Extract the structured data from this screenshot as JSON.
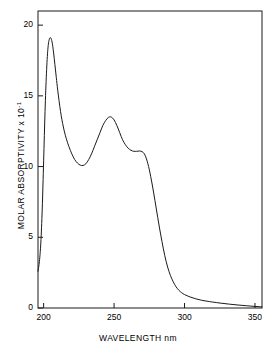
{
  "chart_data": {
    "type": "line",
    "title": "",
    "subtitle": "",
    "xlabel": "WAVELENGTH nm",
    "ylabel": "MOLAR ABSORPTIVITY x 10",
    "ylabel_exponent": "-1",
    "xlim": [
      196,
      355
    ],
    "ylim": [
      0,
      21
    ],
    "xticks": [
      200,
      250,
      300,
      350
    ],
    "xtick_labels": [
      "200",
      "250",
      "300",
      "350"
    ],
    "yticks": [
      0,
      5,
      10,
      15,
      20
    ],
    "ytick_labels": [
      "0",
      "5",
      "10",
      "15",
      "20"
    ],
    "grid": false,
    "legend": null,
    "line_color": "#1a1a1a",
    "line_width": 1.0,
    "frame": true,
    "annotations": [
      {
        "label": "primary peak",
        "x": 205,
        "y": 19.1
      },
      {
        "label": "minimum",
        "x": 228,
        "y": 10.1
      },
      {
        "label": "secondary peak",
        "x": 246,
        "y": 13.5
      },
      {
        "label": "shoulder",
        "x": 268,
        "y": 11.1
      },
      {
        "label": "baseline tail",
        "x": 350,
        "y": 0.1
      }
    ],
    "series": [
      {
        "name": "absorption spectrum",
        "x": [
          196,
          197,
          198,
          199,
          200,
          201,
          202,
          203,
          204,
          205,
          206,
          207,
          208,
          209,
          210,
          212,
          214,
          216,
          218,
          220,
          222,
          224,
          226,
          228,
          230,
          232,
          234,
          236,
          238,
          240,
          242,
          244,
          246,
          248,
          250,
          252,
          254,
          256,
          258,
          260,
          262,
          264,
          266,
          268,
          270,
          272,
          274,
          276,
          278,
          280,
          282,
          284,
          286,
          288,
          290,
          292,
          294,
          296,
          298,
          300,
          304,
          308,
          312,
          316,
          320,
          326,
          332,
          338,
          344,
          350,
          355
        ],
        "y": [
          2.6,
          3.3,
          4.6,
          7.0,
          10.4,
          13.9,
          16.6,
          18.3,
          19.0,
          19.1,
          18.8,
          18.1,
          17.2,
          16.3,
          15.4,
          13.9,
          12.8,
          12.0,
          11.4,
          10.9,
          10.5,
          10.25,
          10.1,
          10.08,
          10.2,
          10.5,
          10.9,
          11.4,
          11.9,
          12.4,
          12.9,
          13.25,
          13.48,
          13.5,
          13.3,
          12.9,
          12.4,
          11.9,
          11.55,
          11.3,
          11.15,
          11.08,
          11.08,
          11.1,
          11.05,
          10.8,
          10.2,
          9.3,
          8.2,
          7.0,
          5.8,
          4.7,
          3.7,
          2.9,
          2.3,
          1.85,
          1.5,
          1.25,
          1.08,
          0.95,
          0.78,
          0.65,
          0.55,
          0.48,
          0.42,
          0.34,
          0.27,
          0.21,
          0.16,
          0.11,
          0.08
        ]
      }
    ]
  },
  "axis_geometry": {
    "plot_left": 38,
    "plot_right": 262,
    "plot_top": 11,
    "plot_bottom": 308
  }
}
